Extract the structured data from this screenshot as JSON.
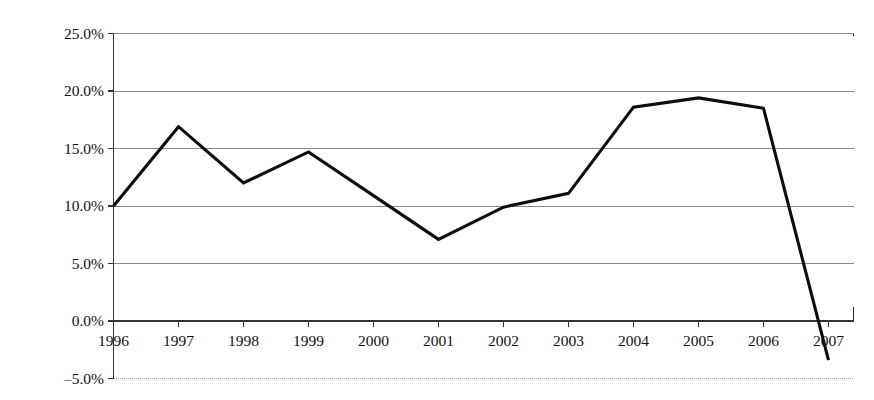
{
  "chart_data": {
    "type": "line",
    "title": "",
    "xlabel": "",
    "ylabel": "Total Return",
    "categories": [
      "1996",
      "1997",
      "1998",
      "1999",
      "2000",
      "2001",
      "2002",
      "2003",
      "2004",
      "2005",
      "2006",
      "2007"
    ],
    "values": [
      10.0,
      16.9,
      12.0,
      14.7,
      10.9,
      7.1,
      9.9,
      11.1,
      18.6,
      19.4,
      18.5,
      -3.4
    ],
    "series": [
      {
        "name": "Total Return",
        "values": [
          10.0,
          16.9,
          12.0,
          14.7,
          10.9,
          7.1,
          9.9,
          11.1,
          18.6,
          19.4,
          18.5,
          -3.4
        ]
      }
    ],
    "ylim": [
      -5.0,
      25.0
    ],
    "ytick_values": [
      25.0,
      20.0,
      15.0,
      10.0,
      5.0,
      0.0,
      -5.0
    ],
    "ytick_labels": [
      "25.0%",
      "20.0%",
      "15.0%",
      "10.0%",
      "5.0%",
      "0.0%",
      "–5.0%"
    ],
    "xtick_labels": [
      "1996",
      "1997",
      "1998",
      "1999",
      "2000",
      "2001",
      "2002",
      "2003",
      "2004",
      "2005",
      "2006",
      "2007"
    ],
    "grid": true,
    "legend": "none",
    "line_color": "#0d0d0d",
    "grid_color": "#7a7a7a",
    "axis_color": "#333333",
    "background_color": "#ffffff"
  }
}
